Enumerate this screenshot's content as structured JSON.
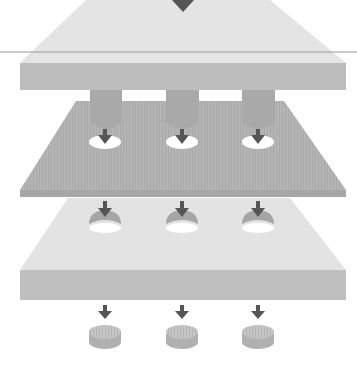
{
  "diagram": {
    "description": "Punching / die-cutting process: punch plate with three punches pierces a sheet over a die plate; three slugs (discs) drop out below.",
    "stages": [
      {
        "id": "punch-plate",
        "label": "Punch plate with punches"
      },
      {
        "id": "sheet",
        "label": "Sheet material with punched holes"
      },
      {
        "id": "die-plate",
        "label": "Die plate with openings"
      },
      {
        "id": "slugs",
        "label": "Punched-out slugs"
      }
    ],
    "punch_count": 3,
    "colors": {
      "background": "#ffffff",
      "plate_top_light": "#e3e3e3",
      "plate_front": "#bdbdbd",
      "sheet": "#b3b3b3",
      "sheet_edge": "#a6a6a6",
      "punch": "#a9a9a9",
      "arrow": "#555555",
      "hole": "#ffffff",
      "slug_side": "#b0b0b0",
      "slug_top": "#c4c4c4",
      "guide_line": "#9a9a9a"
    }
  }
}
